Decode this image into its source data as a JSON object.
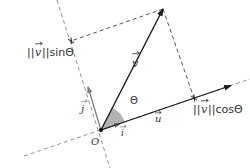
{
  "diagram": {
    "labels": {
      "v": "v",
      "u": "u",
      "i": "i",
      "j": "j",
      "origin": "O",
      "theta": "Θ",
      "sin_component": "||v||sinΘ",
      "cos_component": "||v||cosΘ",
      "sin_norm_left": "||",
      "sin_norm_right": "||sinΘ",
      "cos_norm_left": "||",
      "cos_norm_right": "||cosΘ"
    },
    "points": {
      "origin": [
        101,
        130
      ],
      "v_tip": [
        163,
        9
      ],
      "cos_foot": [
        194,
        98
      ],
      "sin_foot": [
        71,
        41
      ],
      "u_tip": [
        230,
        86
      ],
      "i_tip": [
        119,
        124
      ],
      "j_tip": [
        88,
        87
      ]
    },
    "colors": {
      "main_vector": "#1a1a1a",
      "basis_vector": "#777777",
      "dashed": "#555555",
      "angle_fill": "#b3b3b3",
      "text": "#333333"
    }
  }
}
